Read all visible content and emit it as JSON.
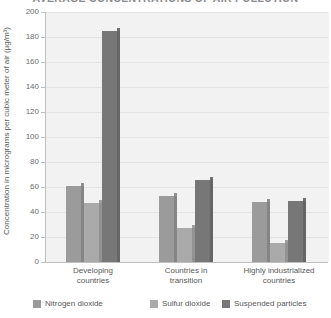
{
  "chart_data": {
    "type": "bar",
    "title": "AVERAGE CONCENTRATIONS OF AIR POLLUTION",
    "xlabel": "",
    "ylabel": "Concentration in micrograms per cubic meter of air (µg/m³)",
    "categories": [
      "Developing countries",
      "Countries in transition",
      "Highly industrialized countries"
    ],
    "category_lines": [
      [
        "Developing",
        "countries"
      ],
      [
        "Countries in",
        "transition"
      ],
      [
        "Highly industrialized",
        "countries"
      ]
    ],
    "series": [
      {
        "name": "Nitrogen dioxide",
        "color": "#9b9b9b",
        "values": [
          61,
          53,
          48
        ]
      },
      {
        "name": "Sulfur dioxide",
        "color": "#aaaaaa",
        "values": [
          47,
          27,
          15
        ]
      },
      {
        "name": "Suspended particles",
        "color": "#777777",
        "values": [
          185,
          66,
          49
        ]
      }
    ],
    "ylim": [
      0,
      200
    ],
    "yticks": [
      0,
      20,
      40,
      60,
      80,
      100,
      120,
      140,
      160,
      180,
      200
    ],
    "ytick_labels": [
      "0",
      "20",
      "40",
      "60",
      "80",
      "100",
      "120",
      "140",
      "160",
      "180",
      "200"
    ],
    "grid": true,
    "legend_position": "bottom",
    "plot_background": "#f2f2f2",
    "axis_color": "#bfbfbf"
  }
}
